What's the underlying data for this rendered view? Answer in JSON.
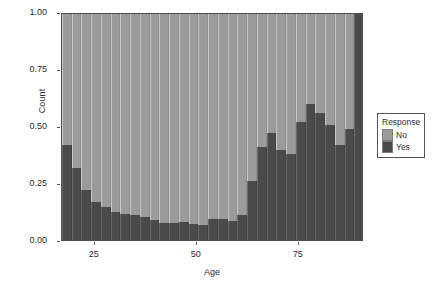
{
  "chart_data": {
    "type": "bar",
    "subtype": "stacked-proportion-histogram",
    "title": "",
    "subtitle": "",
    "xlabel": "Age",
    "ylabel": "Count",
    "xlim": [
      17,
      91
    ],
    "ylim": [
      0.0,
      1.0
    ],
    "grid": false,
    "x_ticks": [
      25,
      50,
      75
    ],
    "x_tick_labels": [
      "25",
      "50",
      "75"
    ],
    "y_ticks": [
      0.0,
      0.25,
      0.5,
      0.75,
      1.0
    ],
    "y_tick_labels": [
      "0.00",
      "0.25",
      "0.50",
      "0.75",
      "1.00"
    ],
    "legend": {
      "title": "Response",
      "position": "right",
      "entries": [
        {
          "name": "No",
          "color": "#9b9b9b"
        },
        {
          "name": "Yes",
          "color": "#4a4a4a"
        }
      ]
    },
    "bin_centers": [
      18,
      20.5,
      23,
      25.5,
      28,
      30.5,
      33,
      35.5,
      38,
      40.5,
      43,
      45.5,
      48,
      50.5,
      53,
      55.5,
      58,
      60.5,
      63,
      65.5,
      68,
      70.5,
      73,
      75.5,
      78,
      80.5,
      83,
      85.5,
      88,
      90
    ],
    "series": [
      {
        "name": "Yes",
        "color": "#4a4a4a",
        "values": [
          0.42,
          0.32,
          0.22,
          0.17,
          0.145,
          0.125,
          0.115,
          0.11,
          0.1,
          0.09,
          0.075,
          0.075,
          0.08,
          0.07,
          0.065,
          0.095,
          0.095,
          0.085,
          0.11,
          0.26,
          0.41,
          0.475,
          0.4,
          0.38,
          0.52,
          0.6,
          0.56,
          0.51,
          0.42,
          0.49,
          1.0
        ]
      },
      {
        "name": "No",
        "color": "#9b9b9b",
        "values": [
          0.58,
          0.68,
          0.78,
          0.83,
          0.855,
          0.875,
          0.885,
          0.89,
          0.9,
          0.91,
          0.925,
          0.925,
          0.92,
          0.93,
          0.935,
          0.905,
          0.905,
          0.915,
          0.89,
          0.74,
          0.59,
          0.525,
          0.6,
          0.62,
          0.48,
          0.4,
          0.44,
          0.49,
          0.58,
          0.51,
          0.0
        ]
      }
    ]
  },
  "axes": {
    "y_title": "Count",
    "x_title": "Age"
  }
}
